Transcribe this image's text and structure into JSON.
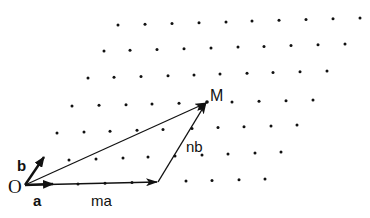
{
  "diagram": {
    "labels": {
      "origin": "O",
      "vec_a": "a",
      "vec_b": "b",
      "ma": "ma",
      "nb": "nb",
      "point_m": "M"
    },
    "colors": {
      "ink": "#111111",
      "background": "#ffffff"
    },
    "points": {
      "O": [
        25,
        185
      ],
      "a_tip": [
        52,
        184
      ],
      "b_tip": [
        43,
        158
      ],
      "ma_end": [
        158,
        182
      ],
      "M": [
        207,
        102
      ]
    },
    "lattice_rows": [
      {
        "y0": 25,
        "y1": 18,
        "xs": [
          118,
          145,
          172,
          199,
          226,
          252,
          279,
          306,
          333,
          360
        ]
      },
      {
        "y0": 51,
        "y1": 44,
        "xs": [
          104,
          130,
          157,
          184,
          211,
          238,
          264,
          291,
          318,
          345
        ]
      },
      {
        "y0": 78,
        "y1": 71,
        "xs": [
          88,
          114,
          141,
          168,
          194,
          220,
          247,
          273,
          300,
          327
        ]
      },
      {
        "y0": 106,
        "y1": 100,
        "xs": [
          72,
          99,
          126,
          152,
          179,
          232,
          259,
          286,
          313
        ]
      },
      {
        "y0": 133,
        "y1": 125,
        "xs": [
          57,
          84,
          110,
          137,
          163,
          192,
          218,
          244,
          271,
          297
        ]
      },
      {
        "y0": 160,
        "y1": 152,
        "xs": [
          69,
          96,
          123,
          148,
          175,
          202,
          228,
          255,
          281
        ]
      },
      {
        "y0": 184,
        "y1": 179,
        "xs": [
          78,
          105,
          132,
          186,
          212,
          239,
          265
        ]
      }
    ]
  }
}
